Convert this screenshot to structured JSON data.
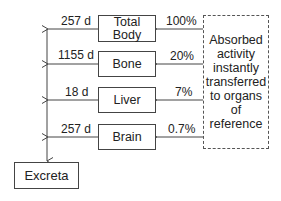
{
  "diagram": {
    "source_box": {
      "label": "Absorbed activity instantly transferred to organs of reference",
      "lines": [
        "Absorbed",
        "activity",
        "instantly",
        "transferred",
        "to organs of",
        "reference"
      ]
    },
    "organs": [
      {
        "name": "Total Body",
        "lines": [
          "Total",
          "Body"
        ],
        "fraction": "100%",
        "half_life": "257 d"
      },
      {
        "name": "Bone",
        "fraction": "20%",
        "half_life": "1155 d"
      },
      {
        "name": "Liver",
        "fraction": "7%",
        "half_life": "18 d"
      },
      {
        "name": "Brain",
        "fraction": "0.7%",
        "half_life": "257 d"
      }
    ],
    "sink": {
      "label": "Excreta"
    }
  }
}
